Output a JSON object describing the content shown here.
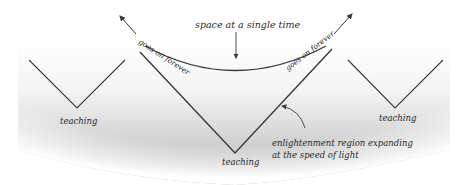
{
  "diagram": {
    "labels": {
      "space_at_single_time": "space at a single time",
      "goes_on_forever_left": "goes on forever",
      "goes_on_forever_right": "goes on forever",
      "teaching_left": "teaching",
      "teaching_center": "teaching",
      "teaching_right": "teaching",
      "enlightenment_line1": "enlightenment region expanding",
      "enlightenment_line2": "at the speed of light"
    },
    "colors": {
      "ink": "#2a2a2a",
      "shade_light": "#ffffff",
      "shade_dark": "#b8b8b8"
    }
  }
}
